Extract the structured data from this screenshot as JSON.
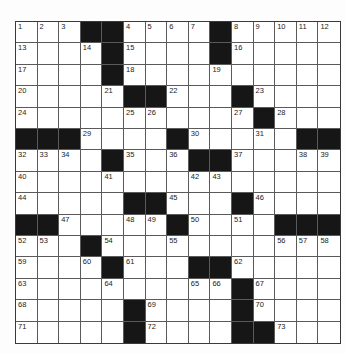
{
  "puzzle": {
    "rows": 15,
    "cols": 15,
    "colors": {
      "block": "#161616",
      "cell": "#ffffff",
      "line": "#5a5a5a",
      "number": "#222222"
    },
    "grid": [
      [
        "1",
        "2",
        "3",
        "#",
        "#",
        "4",
        "5",
        "6",
        "7",
        "#",
        "8",
        "9",
        "10",
        "11",
        "12"
      ],
      [
        "13",
        "",
        "",
        "14",
        "#",
        "15",
        "",
        "",
        "",
        "#",
        "16",
        "",
        "",
        "",
        ""
      ],
      [
        "17",
        "",
        "",
        "",
        "#",
        "18",
        "",
        "",
        "",
        "19",
        "",
        "",
        "",
        "",
        ""
      ],
      [
        "20",
        "",
        "",
        "",
        "21",
        "#",
        "#",
        "22",
        "",
        "",
        "#",
        "23",
        "",
        "",
        ""
      ],
      [
        "24",
        "",
        "",
        "",
        "",
        "25",
        "26",
        "",
        "",
        "",
        "27",
        "#",
        "28",
        "",
        ""
      ],
      [
        "#",
        "#",
        "#",
        "29",
        "",
        "",
        "",
        "#",
        "30",
        "",
        "",
        "31",
        "",
        "#",
        "#"
      ],
      [
        "32",
        "33",
        "34",
        "",
        "#",
        "35",
        "",
        "36",
        "#",
        "#",
        "37",
        "",
        "",
        "38",
        "39"
      ],
      [
        "40",
        "",
        "",
        "",
        "41",
        "",
        "",
        "",
        "42",
        "43",
        "",
        "",
        "",
        "",
        ""
      ],
      [
        "44",
        "",
        "",
        "",
        "",
        "#",
        "#",
        "45",
        "",
        "",
        "#",
        "46",
        "",
        "",
        ""
      ],
      [
        "#",
        "#",
        "47",
        "",
        "",
        "48",
        "49",
        "#",
        "50",
        "",
        "51",
        "",
        "#",
        "#",
        "#"
      ],
      [
        "52",
        "53",
        "",
        "#",
        "54",
        "",
        "",
        "55",
        "",
        "",
        "",
        "",
        "56",
        "57",
        "58"
      ],
      [
        "59",
        "",
        "",
        "60",
        "#",
        "61",
        "",
        "",
        "#",
        "#",
        "62",
        "",
        "",
        "",
        ""
      ],
      [
        "63",
        "",
        "",
        "",
        "64",
        "",
        "",
        "",
        "65",
        "66",
        "#",
        "67",
        "",
        "",
        ""
      ],
      [
        "68",
        "",
        "",
        "",
        "",
        "#",
        "69",
        "",
        "",
        "",
        "#",
        "70",
        "",
        "",
        ""
      ],
      [
        "71",
        "",
        "",
        "",
        "",
        "#",
        "72",
        "",
        "",
        "",
        "#",
        "#",
        "73",
        "",
        ""
      ]
    ]
  }
}
